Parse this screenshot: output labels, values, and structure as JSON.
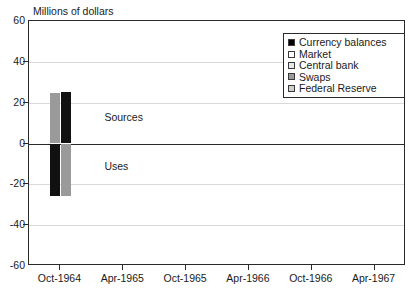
{
  "chart_data": {
    "type": "bar",
    "title": "",
    "ylabel": "Millions of dollars",
    "xlabel": "",
    "ylim": [
      -60,
      60
    ],
    "yticks": [
      60,
      40,
      20,
      0,
      -20,
      -40,
      -60
    ],
    "categories": [
      "Oct-1964",
      "Apr-1965",
      "Oct-1965",
      "Apr-1966",
      "Oct-1966",
      "Apr-1967"
    ],
    "grid": "horizontal",
    "legend_position": "top-right",
    "stacked": true,
    "series": [
      {
        "name": "Currency balances",
        "color": "#000000",
        "values": [
          25,
          0,
          0,
          0,
          0,
          0
        ]
      },
      {
        "name": "Market",
        "color": "#ffffff",
        "values": [
          0,
          0,
          0,
          0,
          0,
          0
        ]
      },
      {
        "name": "Central bank",
        "color": "#e8e8e8",
        "values": [
          0,
          0,
          0,
          0,
          0,
          0
        ]
      },
      {
        "name": "Swaps",
        "color": "#9a9a9a",
        "values": [
          -25,
          0,
          0,
          0,
          0,
          0
        ]
      },
      {
        "name": "Federal Reserve",
        "color": "#cfcfcf",
        "values": [
          0,
          0,
          0,
          0,
          0,
          0
        ]
      }
    ],
    "annotations": [
      {
        "text": "Sources",
        "x": "Oct-1964",
        "y": 12
      },
      {
        "text": "Uses",
        "x": "Oct-1964",
        "y": -12
      }
    ],
    "bars": [
      {
        "category": "Oct-1964",
        "slot": 0,
        "top": 24.5,
        "bottom": 0,
        "color": "#9a9a9a"
      },
      {
        "category": "Oct-1964",
        "slot": 0,
        "top": 0,
        "bottom": -25.5,
        "color": "#111111"
      },
      {
        "category": "Oct-1964",
        "slot": 1,
        "top": 25.0,
        "bottom": 0,
        "color": "#111111"
      },
      {
        "category": "Oct-1964",
        "slot": 1,
        "top": 0,
        "bottom": -25.5,
        "color": "#9a9a9a"
      }
    ]
  },
  "legend": {
    "items": [
      {
        "label": "Currency balances",
        "color": "#000000"
      },
      {
        "label": "Market",
        "color": "#ffffff"
      },
      {
        "label": "Central bank",
        "color": "#e8e8e8"
      },
      {
        "label": "Swaps",
        "color": "#9a9a9a"
      },
      {
        "label": "Federal Reserve",
        "color": "#cfcfcf"
      }
    ]
  }
}
